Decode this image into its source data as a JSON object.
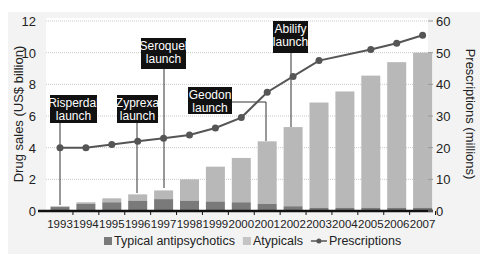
{
  "chart_data": {
    "type": "bar",
    "subtype": "stacked bar with line overlay (dual axis)",
    "title": "",
    "categories": [
      "1993",
      "1994",
      "1995",
      "1996",
      "1997",
      "1998",
      "1999",
      "2000",
      "2001",
      "2002",
      "2003",
      "2004",
      "2005",
      "2006",
      "2007"
    ],
    "series": [
      {
        "name": "Typical antipsychotics",
        "type": "bar",
        "axis": "left",
        "color": "#7a7a7a",
        "values": [
          0.25,
          0.45,
          0.55,
          0.65,
          0.75,
          0.65,
          0.6,
          0.55,
          0.45,
          0.3,
          0.2,
          0.2,
          0.2,
          0.2,
          0.2
        ]
      },
      {
        "name": "Atypicals",
        "type": "bar",
        "axis": "left",
        "color": "#b8b8b8",
        "values": [
          0.05,
          0.1,
          0.25,
          0.4,
          0.55,
          1.35,
          2.2,
          2.8,
          3.95,
          5.0,
          6.65,
          7.35,
          8.35,
          9.2,
          9.8
        ]
      },
      {
        "name": "Prescriptions",
        "type": "line",
        "axis": "right",
        "color": "#555555",
        "values": [
          20,
          20,
          21,
          22,
          23,
          24,
          26.2,
          29.5,
          37.5,
          42.5,
          47.5,
          null,
          51,
          53,
          55.5
        ],
        "interpolate_missing": true
      }
    ],
    "xlabel": "",
    "ylabel": "Drug sales (US$ billion)",
    "ylim": [
      0,
      12
    ],
    "yticks": [
      0,
      2,
      4,
      6,
      8,
      10,
      12
    ],
    "y2label": "Prescriptions (millions)",
    "y2lim": [
      0,
      60
    ],
    "y2ticks": [
      0,
      10,
      20,
      30,
      40,
      50,
      60
    ],
    "grid": true,
    "legend_position": "bottom",
    "annotations": [
      {
        "text": [
          "Risperdal",
          "launch"
        ],
        "year": "1993"
      },
      {
        "text": [
          "Zyprexa",
          "launch"
        ],
        "year": "1996"
      },
      {
        "text": [
          "Seroquel",
          "launch"
        ],
        "year": "1997"
      },
      {
        "text": [
          "Geodon",
          "launch"
        ],
        "year": "2001"
      },
      {
        "text": [
          "Abilify",
          "launch"
        ],
        "year": "2002"
      }
    ],
    "legend": [
      {
        "label": "Typical antipsychotics",
        "marker": "square",
        "color": "#7a7a7a"
      },
      {
        "label": "Atypicals",
        "marker": "square",
        "color": "#c4c4c4"
      },
      {
        "label": "Prescriptions",
        "marker": "line-dot",
        "color": "#555555"
      }
    ]
  }
}
